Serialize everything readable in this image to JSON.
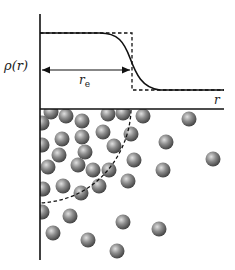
{
  "figure": {
    "type": "density-profile-diagram",
    "upper_plot": {
      "y_label": "ρ(r)",
      "x_label": "r",
      "radius_label_main": "r",
      "radius_label_sub": "e",
      "curves": [
        "smooth density profile (solid)",
        "step function (dashed)"
      ]
    },
    "lower_panel": {
      "description": "particles near interface with dashed circular boundary of radius r_e"
    }
  },
  "colors": {
    "line": "#111111",
    "particle_light": "#d6d6d6",
    "particle_mid": "#8a8a8a",
    "particle_dark": "#3a3a3a"
  },
  "particles": [
    [
      51,
      112
    ],
    [
      66,
      116
    ],
    [
      82,
      121
    ],
    [
      108,
      114
    ],
    [
      123,
      113
    ],
    [
      143,
      116
    ],
    [
      189,
      119
    ],
    [
      42,
      123
    ],
    [
      62,
      139
    ],
    [
      82,
      137
    ],
    [
      103,
      132
    ],
    [
      131,
      134
    ],
    [
      166,
      142
    ],
    [
      42,
      145
    ],
    [
      59,
      155
    ],
    [
      85,
      152
    ],
    [
      114,
      146
    ],
    [
      134,
      160
    ],
    [
      213,
      159
    ],
    [
      48,
      167
    ],
    [
      78,
      165
    ],
    [
      93,
      170
    ],
    [
      109,
      170
    ],
    [
      163,
      170
    ],
    [
      128,
      181
    ],
    [
      43,
      189
    ],
    [
      63,
      186
    ],
    [
      81,
      193
    ],
    [
      99,
      186
    ],
    [
      42,
      212
    ],
    [
      70,
      216
    ],
    [
      123,
      222
    ],
    [
      159,
      229
    ],
    [
      53,
      233
    ],
    [
      88,
      240
    ],
    [
      117,
      251
    ]
  ]
}
